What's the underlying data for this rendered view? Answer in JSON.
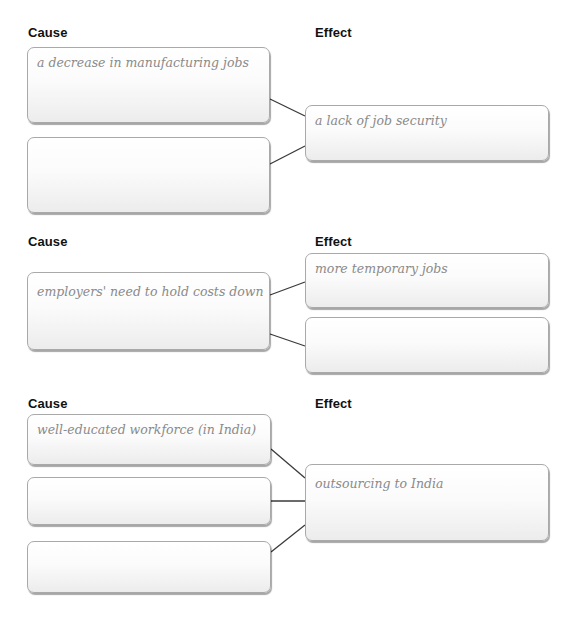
{
  "sections": [
    {
      "cause_label": "Cause",
      "effect_label": "Effect",
      "causes": [
        "a decrease in manufacturing jobs",
        ""
      ],
      "effects": [
        "a lack of job security"
      ]
    },
    {
      "cause_label": "Cause",
      "effect_label": "Effect",
      "causes": [
        "employers' need to hold costs down"
      ],
      "effects": [
        "more temporary jobs",
        ""
      ]
    },
    {
      "cause_label": "Cause",
      "effect_label": "Effect",
      "causes": [
        "well-educated workforce (in India)",
        "",
        ""
      ],
      "effects": [
        "outsourcing to India"
      ]
    }
  ],
  "colors": {
    "line": "#3a3a3a",
    "box_border": "#a9a9a9",
    "handwriting": "#8a8a8a"
  }
}
